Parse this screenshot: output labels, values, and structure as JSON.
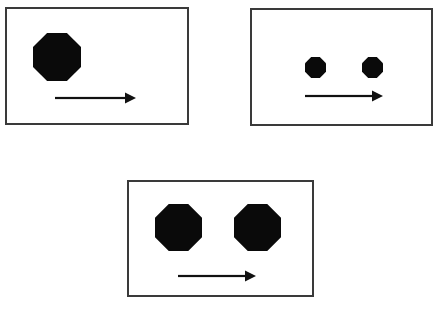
{
  "figure": {
    "canvas": {
      "width": 444,
      "height": 311
    },
    "background_color": "#ffffff",
    "shape_color": "#0a0a0a",
    "border_color": "#3a3a3a",
    "arrow_color": "#111111",
    "panel_count": 3,
    "panels": [
      {
        "id": "panel-top-left",
        "position_label": "top-left",
        "frame": {
          "x": 5,
          "y": 7,
          "width": 184,
          "height": 118
        },
        "shape_name": "octagon",
        "shape_count": 1,
        "shapes": [
          {
            "x": 33,
            "y": 33,
            "size": 48,
            "label": "octagon-large-1"
          }
        ],
        "arrow": {
          "label": "rightward-arrow",
          "direction": "right",
          "x": 55,
          "y": 91,
          "length": 81
        }
      },
      {
        "id": "panel-top-right",
        "position_label": "top-right",
        "frame": {
          "x": 250,
          "y": 8,
          "width": 183,
          "height": 118
        },
        "shape_name": "octagon",
        "shape_count": 2,
        "shapes": [
          {
            "x": 305,
            "y": 57,
            "size": 21,
            "label": "octagon-small-1"
          },
          {
            "x": 362,
            "y": 57,
            "size": 21,
            "label": "octagon-small-2"
          }
        ],
        "arrow": {
          "label": "rightward-arrow",
          "direction": "right",
          "x": 305,
          "y": 89,
          "length": 78
        }
      },
      {
        "id": "panel-bottom-center",
        "position_label": "bottom-center",
        "frame": {
          "x": 127,
          "y": 180,
          "width": 187,
          "height": 117
        },
        "shape_name": "octagon",
        "shape_count": 2,
        "shapes": [
          {
            "x": 155,
            "y": 204,
            "size": 47,
            "label": "octagon-large-1"
          },
          {
            "x": 234,
            "y": 204,
            "size": 47,
            "label": "octagon-large-2"
          }
        ],
        "arrow": {
          "label": "rightward-arrow",
          "direction": "right",
          "x": 178,
          "y": 269,
          "length": 78
        }
      }
    ]
  }
}
